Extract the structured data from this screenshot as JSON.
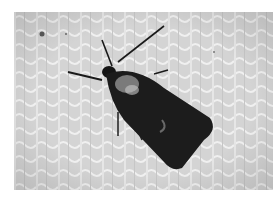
{
  "image": {
    "subject": "moth",
    "description": "Dark moth resting on a light textured fabric, grayscale photograph",
    "colors": {
      "background": "#ffffff",
      "fabric": "#d6d6d6",
      "fabric_light": "#ececec",
      "moth_body": "#1c1c1c",
      "moth_highlight": "#bdbdbd"
    }
  }
}
